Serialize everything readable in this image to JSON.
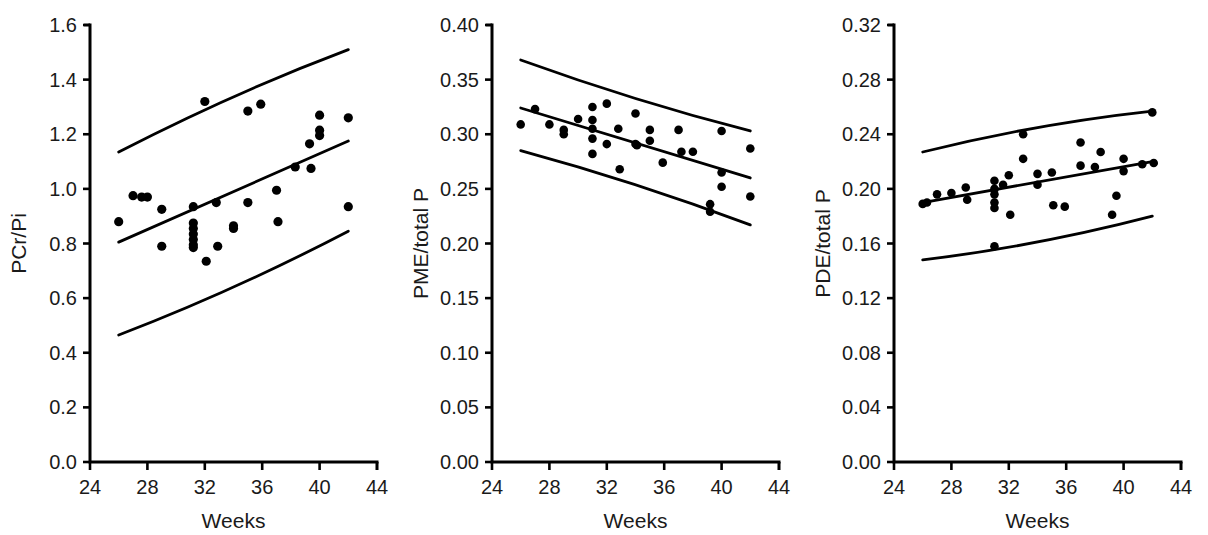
{
  "figure": {
    "panel_count": 3,
    "marker_color": "#000000",
    "line_color": "#000000",
    "background": "#ffffff"
  },
  "chart_data": [
    {
      "type": "scatter",
      "title": "",
      "xlabel": "Weeks",
      "ylabel": "PCr/Pi",
      "xlim": [
        24,
        44
      ],
      "ylim": [
        0.0,
        1.6
      ],
      "xticks": [
        24,
        28,
        32,
        36,
        40,
        44
      ],
      "xticklabels": [
        "24",
        "28",
        "32",
        "36",
        "40",
        "44"
      ],
      "yticks": [
        0.0,
        0.2,
        0.4,
        0.6,
        0.8,
        1.0,
        1.2,
        1.4,
        1.6
      ],
      "yticklabels": [
        "0.0",
        "0.2",
        "0.4",
        "0.6",
        "0.8",
        "1.0",
        "1.2",
        "1.4",
        "1.6"
      ],
      "grid": false,
      "legend": "none",
      "points": [
        [
          26.0,
          0.88
        ],
        [
          27.0,
          0.975
        ],
        [
          27.6,
          0.97
        ],
        [
          28.0,
          0.97
        ],
        [
          29.0,
          0.925
        ],
        [
          29.0,
          0.79
        ],
        [
          31.2,
          0.935
        ],
        [
          31.2,
          0.875
        ],
        [
          31.2,
          0.855
        ],
        [
          31.2,
          0.835
        ],
        [
          31.2,
          0.815
        ],
        [
          31.2,
          0.795
        ],
        [
          31.2,
          0.785
        ],
        [
          32.0,
          1.32
        ],
        [
          32.1,
          0.735
        ],
        [
          32.8,
          0.95
        ],
        [
          32.9,
          0.79
        ],
        [
          34.0,
          0.865
        ],
        [
          34.0,
          0.855
        ],
        [
          35.0,
          0.95
        ],
        [
          35.0,
          1.285
        ],
        [
          35.9,
          1.31
        ],
        [
          37.0,
          0.995
        ],
        [
          37.1,
          0.88
        ],
        [
          38.3,
          1.08
        ],
        [
          39.3,
          1.165
        ],
        [
          39.4,
          1.075
        ],
        [
          40.0,
          1.27
        ],
        [
          40.0,
          1.215
        ],
        [
          40.0,
          1.195
        ],
        [
          42.0,
          1.26
        ],
        [
          42.0,
          0.935
        ]
      ],
      "fit_line": {
        "x": [
          26,
          42
        ],
        "y": [
          0.805,
          1.175
        ]
      },
      "upper_band": {
        "x": [
          26,
          42
        ],
        "y": [
          1.135,
          1.51
        ]
      },
      "lower_band": {
        "x": [
          26,
          42
        ],
        "y": [
          0.465,
          0.845
        ]
      }
    },
    {
      "type": "scatter",
      "title": "",
      "xlabel": "Weeks",
      "ylabel": "PME/total P",
      "xlim": [
        24,
        44
      ],
      "ylim": [
        0.0,
        0.4
      ],
      "xticks": [
        24,
        28,
        32,
        36,
        40,
        44
      ],
      "xticklabels": [
        "24",
        "28",
        "32",
        "36",
        "40",
        "44"
      ],
      "yticks": [
        0.0,
        0.05,
        0.1,
        0.15,
        0.2,
        0.25,
        0.3,
        0.35,
        0.4
      ],
      "yticklabels": [
        "0.00",
        "0.05",
        "0.10",
        "0.15",
        "0.20",
        "0.25",
        "0.30",
        "0.35",
        "0.40"
      ],
      "grid": false,
      "legend": "none",
      "points": [
        [
          26.0,
          0.309
        ],
        [
          27.0,
          0.323
        ],
        [
          28.0,
          0.309
        ],
        [
          29.0,
          0.304
        ],
        [
          29.0,
          0.3
        ],
        [
          30.0,
          0.314
        ],
        [
          31.0,
          0.325
        ],
        [
          31.0,
          0.313
        ],
        [
          31.0,
          0.305
        ],
        [
          31.0,
          0.296
        ],
        [
          31.0,
          0.282
        ],
        [
          32.0,
          0.328
        ],
        [
          32.0,
          0.291
        ],
        [
          32.8,
          0.305
        ],
        [
          32.9,
          0.268
        ],
        [
          34.0,
          0.319
        ],
        [
          34.0,
          0.291
        ],
        [
          34.1,
          0.29
        ],
        [
          35.0,
          0.304
        ],
        [
          35.0,
          0.294
        ],
        [
          35.9,
          0.274
        ],
        [
          37.0,
          0.304
        ],
        [
          37.2,
          0.284
        ],
        [
          38.0,
          0.284
        ],
        [
          39.2,
          0.236
        ],
        [
          39.2,
          0.229
        ],
        [
          40.0,
          0.303
        ],
        [
          40.0,
          0.265
        ],
        [
          40.0,
          0.252
        ],
        [
          42.0,
          0.287
        ],
        [
          42.0,
          0.243
        ]
      ],
      "fit_line": {
        "x": [
          26,
          42
        ],
        "y": [
          0.324,
          0.26
        ]
      },
      "upper_band": {
        "x": [
          26,
          42
        ],
        "y": [
          0.368,
          0.303
        ]
      },
      "lower_band": {
        "x": [
          26,
          42
        ],
        "y": [
          0.285,
          0.217
        ]
      }
    },
    {
      "type": "scatter",
      "title": "",
      "xlabel": "Weeks",
      "ylabel": "PDE/total P",
      "xlim": [
        24,
        44
      ],
      "ylim": [
        0.0,
        0.32
      ],
      "xticks": [
        24,
        28,
        32,
        36,
        40,
        44
      ],
      "xticklabels": [
        "24",
        "28",
        "32",
        "36",
        "40",
        "44"
      ],
      "yticks": [
        0.0,
        0.04,
        0.08,
        0.12,
        0.16,
        0.2,
        0.24,
        0.28,
        0.32
      ],
      "yticklabels": [
        "0.00",
        "0.04",
        "0.08",
        "0.12",
        "0.16",
        "0.20",
        "0.24",
        "0.28",
        "0.32"
      ],
      "grid": false,
      "legend": "none",
      "points": [
        [
          26.0,
          0.189
        ],
        [
          26.3,
          0.19
        ],
        [
          27.0,
          0.196
        ],
        [
          28.0,
          0.197
        ],
        [
          29.0,
          0.201
        ],
        [
          29.1,
          0.192
        ],
        [
          31.0,
          0.206
        ],
        [
          31.0,
          0.2
        ],
        [
          31.0,
          0.196
        ],
        [
          31.0,
          0.19
        ],
        [
          31.0,
          0.186
        ],
        [
          31.0,
          0.158
        ],
        [
          31.6,
          0.203
        ],
        [
          32.0,
          0.21
        ],
        [
          32.1,
          0.181
        ],
        [
          33.0,
          0.24
        ],
        [
          33.0,
          0.222
        ],
        [
          34.0,
          0.211
        ],
        [
          34.0,
          0.203
        ],
        [
          35.0,
          0.212
        ],
        [
          35.1,
          0.188
        ],
        [
          35.9,
          0.187
        ],
        [
          37.0,
          0.234
        ],
        [
          37.0,
          0.217
        ],
        [
          38.0,
          0.216
        ],
        [
          38.4,
          0.227
        ],
        [
          39.2,
          0.181
        ],
        [
          39.5,
          0.195
        ],
        [
          40.0,
          0.222
        ],
        [
          40.0,
          0.213
        ],
        [
          41.3,
          0.218
        ],
        [
          42.0,
          0.256
        ],
        [
          42.1,
          0.219
        ]
      ],
      "fit_line": {
        "x": [
          26,
          42
        ],
        "y": [
          0.19,
          0.22
        ]
      },
      "upper_band": {
        "x": [
          26,
          42
        ],
        "y": [
          0.227,
          0.257
        ]
      },
      "lower_band": {
        "x": [
          26,
          42
        ],
        "y": [
          0.148,
          0.18
        ]
      }
    }
  ]
}
